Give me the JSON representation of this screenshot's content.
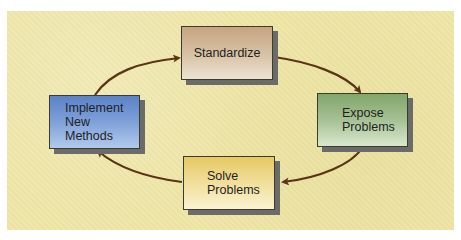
{
  "diagram": {
    "type": "cycle",
    "background_color": "#efe6a6",
    "arrow_color": "#5a3416",
    "nodes": [
      {
        "id": "standardize",
        "label": "Standardize",
        "color_top": "#c6a47f",
        "color_bottom": "#ede3d2"
      },
      {
        "id": "expose",
        "label_line1": "Expose",
        "label_line2": "Problems",
        "color_top": "#82a66a",
        "color_bottom": "#d9e8cd"
      },
      {
        "id": "solve",
        "label_line1": "Solve",
        "label_line2": "Problems",
        "color_top": "#e6c962",
        "color_bottom": "#fbf3d2"
      },
      {
        "id": "implement",
        "label_line1": "Implement",
        "label_line2": "New Methods",
        "color_top": "#5a82c8",
        "color_bottom": "#b1c9ec"
      }
    ],
    "edges": [
      {
        "from": "standardize",
        "to": "expose"
      },
      {
        "from": "expose",
        "to": "solve"
      },
      {
        "from": "solve",
        "to": "implement"
      },
      {
        "from": "implement",
        "to": "standardize"
      }
    ]
  }
}
